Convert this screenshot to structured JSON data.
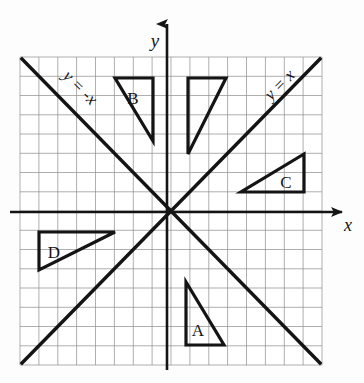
{
  "figure": {
    "background_color": "#fdfdfd",
    "ink_color": "#1a1a1a",
    "grid_color": "#808080"
  },
  "axes": {
    "x_label": "x",
    "y_label": "y",
    "x_axis_name": "x-axis",
    "y_axis_name": "y-axis",
    "origin_px": [
      167,
      212
    ],
    "cell_size_px": 18.9,
    "grid_left_px": 20,
    "grid_top_px": 57,
    "grid_right_px": 322,
    "grid_bottom_px": 365,
    "grid_columns": 16,
    "grid_rows": 16,
    "x_range": [
      -7.8,
      8.2
    ],
    "y_range": [
      -8.1,
      8.2
    ]
  },
  "lines": [
    {
      "name": "line-y-equals-x",
      "label": "y = x",
      "label_parts": {
        "lhs": "y",
        "eq": "=",
        "rhs": "x"
      },
      "slope": 1,
      "intercept": 0,
      "label_position": "upper-right",
      "label_rotation_deg": -45
    },
    {
      "name": "line-y-equals-negative-x",
      "label": "y = -x",
      "label_parts": {
        "lhs": "y",
        "eq": "=",
        "rhs": "-x"
      },
      "slope": -1,
      "intercept": 0,
      "label_position": "upper-left",
      "label_rotation_deg": 45
    }
  ],
  "triangles": [
    {
      "name": "triangle-A",
      "label": "A",
      "quadrant": "IV",
      "right_angle_corner": "bottom-left",
      "vertices_px": [
        [
          186,
          282
        ],
        [
          186,
          345
        ],
        [
          224,
          345
        ]
      ],
      "label_px": [
        198,
        330
      ]
    },
    {
      "name": "triangle-B",
      "label": "B",
      "quadrant": "II",
      "right_angle_corner": "top-right",
      "vertices_px": [
        [
          115,
          78
        ],
        [
          153,
          78
        ],
        [
          153,
          141
        ]
      ],
      "label_px": [
        133,
        98
      ]
    },
    {
      "name": "triangle-C",
      "label": "C",
      "quadrant": "I",
      "right_angle_corner": "bottom-right",
      "vertices_px": [
        [
          241,
          192
        ],
        [
          304,
          192
        ],
        [
          304,
          154
        ]
      ],
      "label_px": [
        286,
        182
      ]
    },
    {
      "name": "triangle-D",
      "label": "D",
      "quadrant": "III",
      "right_angle_corner": "top-left",
      "vertices_px": [
        [
          39,
          232
        ],
        [
          115,
          232
        ],
        [
          39,
          270
        ]
      ],
      "label_px": [
        54,
        252
      ]
    },
    {
      "name": "triangle-unlabeled",
      "label": "",
      "quadrant": "I",
      "right_angle_corner": "top-left",
      "vertices_px": [
        [
          188,
          78
        ],
        [
          226,
          78
        ],
        [
          188,
          154
        ]
      ],
      "label_px": null
    }
  ]
}
